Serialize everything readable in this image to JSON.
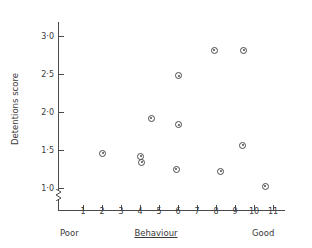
{
  "chart_data": {
    "type": "scatter",
    "title": "",
    "xlabel": "Behaviour",
    "ylabel": "Detentions score",
    "xlabel_low": "Poor",
    "xlabel_high": "Good",
    "xlim": [
      0.3,
      11.7
    ],
    "ylim": [
      0.78,
      3.25
    ],
    "grid": false,
    "legend": null,
    "axis_break_y": true,
    "xticks": [
      1,
      2,
      3,
      4,
      5,
      6,
      7,
      8,
      9,
      10,
      11
    ],
    "xtick_labels": [
      "1",
      "2",
      "3",
      "4",
      "5",
      "6",
      "7",
      "8",
      "9",
      "10",
      "11"
    ],
    "yticks": [
      1.0,
      1.5,
      2.0,
      2.5,
      3.0
    ],
    "ytick_labels": [
      "1·0",
      "1·5",
      "2·0",
      "2·5",
      "3·0"
    ],
    "marker": "circle-with-dot",
    "marker_color": "#4a4a4a",
    "points": [
      {
        "x": 2.05,
        "y": 1.46
      },
      {
        "x": 4.05,
        "y": 1.42
      },
      {
        "x": 4.1,
        "y": 1.34
      },
      {
        "x": 4.6,
        "y": 1.92
      },
      {
        "x": 5.9,
        "y": 1.25
      },
      {
        "x": 6.05,
        "y": 1.83
      },
      {
        "x": 6.05,
        "y": 2.48
      },
      {
        "x": 7.9,
        "y": 2.81
      },
      {
        "x": 8.25,
        "y": 1.22
      },
      {
        "x": 9.4,
        "y": 1.56
      },
      {
        "x": 9.45,
        "y": 2.81
      },
      {
        "x": 10.6,
        "y": 1.02
      }
    ]
  },
  "axes": {
    "y_title": "Detentions score",
    "x_title": "Behaviour",
    "x_low_anchor": "Poor",
    "x_high_anchor": "Good"
  }
}
